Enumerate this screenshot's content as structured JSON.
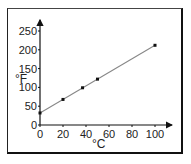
{
  "chart_data": {
    "type": "line",
    "title": "",
    "xlabel": "°C",
    "ylabel": "°F",
    "xlim": [
      0,
      115
    ],
    "ylim": [
      0,
      265
    ],
    "x_ticks": [
      0,
      20,
      40,
      60,
      80,
      100
    ],
    "y_ticks": [
      0,
      50,
      100,
      150,
      200,
      250
    ],
    "grid": false,
    "legend": null,
    "series": [
      {
        "name": "Fahrenheit vs Celsius",
        "x": [
          0,
          20,
          37,
          50,
          100
        ],
        "y": [
          32,
          68,
          99,
          122,
          212
        ],
        "line": "linear fit",
        "color": "#888888",
        "marker_color": "#111111"
      }
    ]
  },
  "labels": {
    "x_axis": "°C",
    "y_axis": "°F",
    "x_ticks": [
      "0",
      "20",
      "40",
      "60",
      "80",
      "100"
    ],
    "y_ticks": [
      "0",
      "50",
      "100",
      "150",
      "200",
      "250"
    ]
  }
}
